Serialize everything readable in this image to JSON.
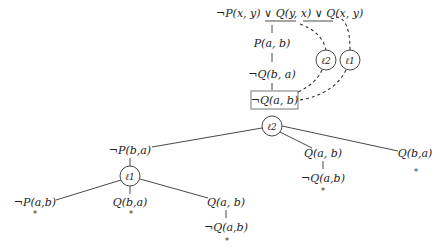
{
  "diagram": {
    "type": "tableau-proof-tree",
    "clause": {
      "literals": [
        "¬P(x, y)",
        "Q(y, x)",
        "Q(x, y)"
      ],
      "connective": "∨",
      "underlined_literals": [
        "Q(y, x)",
        "Q(x, y)"
      ]
    },
    "labels": {
      "l1": "ℓ1",
      "l2": "ℓ2"
    },
    "upper_branch": [
      "P(a, b)",
      "¬Q(b, a)"
    ],
    "boxed_literal": "¬Q(a, b)",
    "l2_children": {
      "left": "¬P(b,a)",
      "middle": "Q(a, b)",
      "middle_child": "¬Q(a,b)",
      "right": "Q(b,a)"
    },
    "l1_children": {
      "left": "¬P(a,b)",
      "middle": "Q(b,a)",
      "right": "Q(a, b)",
      "right_child": "¬Q(a,b)"
    },
    "closed_marker": "*"
  }
}
